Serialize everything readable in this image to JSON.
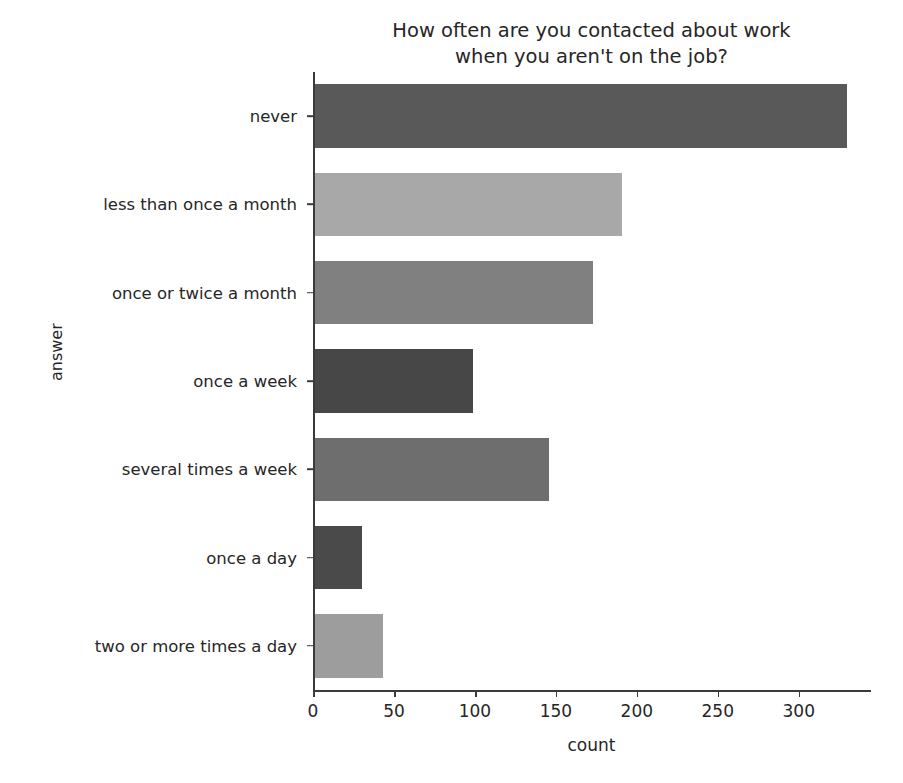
{
  "chart_data": {
    "type": "bar",
    "orientation": "horizontal",
    "title": "How often are you contacted about work\nwhen you aren't on the job?",
    "xlabel": "count",
    "ylabel": "answer",
    "categories": [
      "never",
      "less than once a month",
      "once or twice a month",
      "once a week",
      "several times a week",
      "once a day",
      "two or more times a day"
    ],
    "values": [
      330,
      191,
      173,
      99,
      146,
      30,
      43
    ],
    "bar_colors": [
      "#595959",
      "#a8a8a8",
      "#808080",
      "#474747",
      "#6e6e6e",
      "#4a4a4a",
      "#9d9d9d"
    ],
    "xticks": [
      0,
      50,
      100,
      150,
      200,
      250,
      300
    ],
    "xticklabels": [
      "0",
      "50",
      "100",
      "150",
      "200",
      "250",
      "300"
    ],
    "xlim": [
      0,
      344
    ],
    "grid": false,
    "legend": false,
    "background_color": "#ffffff",
    "axis_color": "#3b3b3b",
    "text_color": "#262626"
  }
}
